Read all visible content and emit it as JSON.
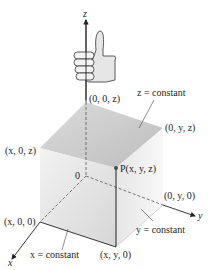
{
  "axes": {
    "x_label": "x",
    "y_label": "y",
    "z_label": "z",
    "origin_label": "0"
  },
  "points": {
    "z_axis_point": "(0, 0, z)",
    "yz_point": "(0, y, z)",
    "xz_point": "(x, 0, z)",
    "P": "P(x, y, z)",
    "y_axis_point": "(0, y, 0)",
    "x_axis_point": "(x, 0, 0)",
    "xy_point": "(x, y, 0)"
  },
  "planes": {
    "z_plane": "z = constant",
    "y_plane": "y = constant",
    "x_plane": "x = constant"
  },
  "colors": {
    "top_face": "#c8c8c8",
    "left_face": "#e4e4e4",
    "right_face": "#eeeeee",
    "front_face": "#d9d9d9",
    "axis": "#231f20",
    "point": "#4a4a4a"
  },
  "icon": "right-hand-thumbs-up-icon"
}
